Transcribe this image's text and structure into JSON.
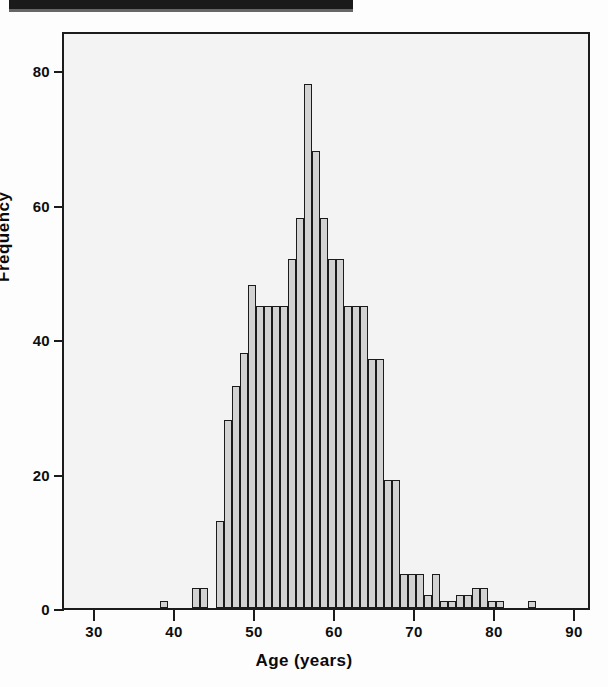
{
  "page": {
    "background_color": "#fdfdfd",
    "rule_color": "#1a1a1a"
  },
  "chart_data": {
    "type": "bar",
    "title": "",
    "xlabel": "Age (years)",
    "ylabel": "Frequency",
    "xlim": [
      26,
      92
    ],
    "ylim": [
      0,
      86
    ],
    "grid": false,
    "legend": null,
    "bin_width": 1,
    "bar_fill": "#d2d2d2",
    "bar_edge": "#1b1b1b",
    "plot_background": "#f3f3f3",
    "xticks": [
      30,
      40,
      50,
      60,
      70,
      80,
      90
    ],
    "yticks": [
      0,
      20,
      40,
      60,
      80
    ],
    "xtick_labels": [
      "30",
      "40",
      "50",
      "60",
      "70",
      "80",
      "90"
    ],
    "ytick_labels": [
      "0",
      "20",
      "40",
      "60",
      "80"
    ],
    "categories": [
      38,
      42,
      43,
      45,
      46,
      47,
      48,
      49,
      50,
      51,
      52,
      53,
      54,
      55,
      56,
      57,
      58,
      59,
      60,
      61,
      62,
      63,
      64,
      65,
      66,
      67,
      68,
      69,
      70,
      71,
      72,
      73,
      74,
      75,
      76,
      77,
      78,
      79,
      80,
      84
    ],
    "values": [
      1,
      3,
      3,
      13,
      28,
      33,
      38,
      48,
      45,
      45,
      45,
      45,
      52,
      58,
      78,
      68,
      58,
      52,
      52,
      45,
      45,
      45,
      37,
      37,
      19,
      19,
      5,
      5,
      5,
      2,
      5,
      1,
      1,
      2,
      2,
      3,
      3,
      1,
      1,
      1
    ]
  },
  "axes": {
    "y_title": "Frequency",
    "x_title": "Age (years)"
  }
}
